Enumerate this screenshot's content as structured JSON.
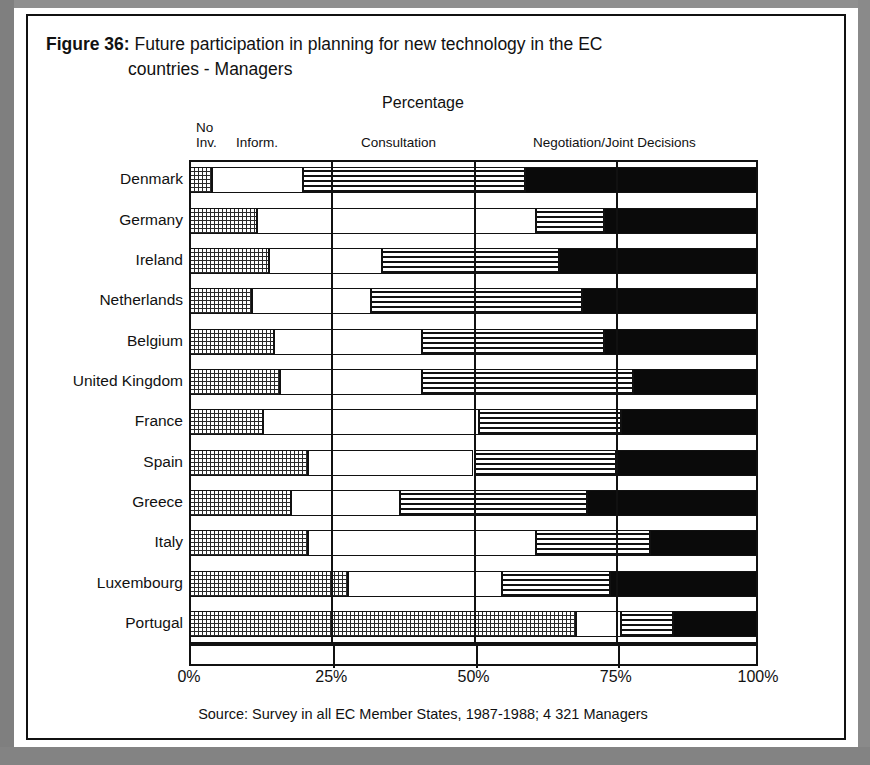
{
  "figure": {
    "label": "Figure 36:",
    "title_line1": "Future participation in planning for new technology in the EC",
    "title_line2": "countries - Managers",
    "axis_caption": "Percentage",
    "source": "Source: Survey in all EC Member States, 1987-1988; 4 321 Managers"
  },
  "legend": {
    "no_involvement_line1": "No",
    "no_involvement_line2": "Inv.",
    "information": "Inform.",
    "consultation": "Consultation",
    "negotiation": "Negotiation/Joint Decisions"
  },
  "xaxis": {
    "ticks": [
      "0%",
      "25%",
      "50%",
      "75%",
      "100%"
    ]
  },
  "colors": {
    "ink": "#111111",
    "paper": "#ffffff",
    "negotiation_fill": "#0a0a0a",
    "page_surround": "#8d8d8d"
  },
  "chart_data": {
    "type": "bar",
    "orientation": "horizontal",
    "stacked": true,
    "stack_normalized_to": 100,
    "title": "Figure 36: Future participation in planning for new technology in the EC countries - Managers",
    "subtitle": "Percentage",
    "xlabel": "Percentage",
    "ylabel": "",
    "xlim": [
      0,
      100
    ],
    "xticks": [
      0,
      25,
      50,
      75,
      100
    ],
    "grid": true,
    "legend_position": "top",
    "categories": [
      "Denmark",
      "Germany",
      "Ireland",
      "Netherlands",
      "Belgium",
      "United Kingdom",
      "France",
      "Spain",
      "Greece",
      "Italy",
      "Luxembourg",
      "Portugal"
    ],
    "series": [
      {
        "name": "No Inv.",
        "pattern": "checkered",
        "values": [
          4,
          12,
          14,
          11,
          15,
          16,
          13,
          21,
          18,
          21,
          28,
          68
        ]
      },
      {
        "name": "Inform.",
        "pattern": "white",
        "values": [
          16,
          49,
          20,
          21,
          26,
          25,
          38,
          29,
          19,
          40,
          27,
          8
        ]
      },
      {
        "name": "Consultation",
        "pattern": "horizontal-lines",
        "values": [
          39,
          12,
          31,
          37,
          32,
          37,
          25,
          25,
          33,
          20,
          19,
          9
        ]
      },
      {
        "name": "Negotiation/Joint Decisions",
        "pattern": "solid-black",
        "values": [
          41,
          27,
          35,
          31,
          27,
          22,
          24,
          25,
          30,
          19,
          26,
          15
        ]
      }
    ],
    "cumulative_boundaries": {
      "Denmark": [
        4,
        20,
        59
      ],
      "Germany": [
        12,
        61,
        73
      ],
      "Ireland": [
        14,
        34,
        65
      ],
      "Netherlands": [
        11,
        32,
        69
      ],
      "Belgium": [
        15,
        41,
        73
      ],
      "United Kingdom": [
        16,
        41,
        78
      ],
      "France": [
        13,
        51,
        76
      ],
      "Spain": [
        21,
        50,
        75
      ],
      "Greece": [
        18,
        37,
        70
      ],
      "Italy": [
        21,
        61,
        81
      ],
      "Luxembourg": [
        28,
        55,
        74
      ],
      "Portugal": [
        68,
        76,
        85
      ]
    }
  }
}
